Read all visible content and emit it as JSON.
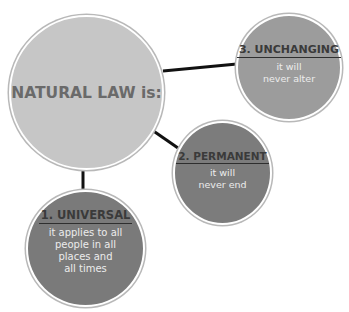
{
  "diagram": {
    "center": {
      "label": "NATURAL LAW is:",
      "color": "#c6c6c6"
    },
    "nodes": [
      {
        "id": "universal",
        "title": "1. UNIVERSAL",
        "lines": [
          "it applies to all",
          "people in all",
          "places and",
          "all times"
        ],
        "color": "#7a7a7a"
      },
      {
        "id": "permanent",
        "title": "2. PERMANENT",
        "lines": [
          "it will",
          "never end"
        ],
        "color": "#7c7c7c"
      },
      {
        "id": "unchanging",
        "title": "3. UNCHANGING",
        "lines": [
          "it will",
          "never alter"
        ],
        "color": "#9c9c9c"
      }
    ],
    "connector_color": "#111111",
    "title_color": "#3a3a3a",
    "body_text_color": "#ececec"
  }
}
